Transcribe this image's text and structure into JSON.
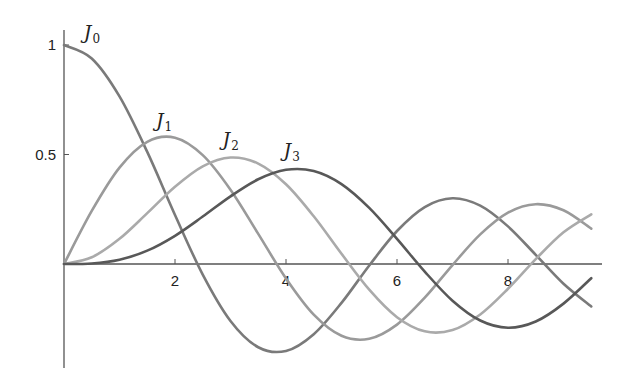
{
  "chart_data": {
    "type": "line",
    "title": "",
    "xlabel": "",
    "ylabel": "",
    "xlim": [
      0,
      9.7
    ],
    "ylim": [
      -0.45,
      1.07
    ],
    "grid": false,
    "legend": "inline labels near curve peaks",
    "x_ticks": [
      2,
      4,
      6,
      8
    ],
    "x_tick_labels": [
      "2",
      "4",
      "6",
      "8"
    ],
    "y_ticks": [
      0.5,
      1
    ],
    "y_tick_labels": [
      "0.5",
      "1"
    ],
    "x": [
      0,
      0.5,
      1,
      1.5,
      2,
      2.5,
      3,
      3.5,
      4,
      4.5,
      5,
      5.5,
      6,
      6.5,
      7,
      7.5,
      8,
      8.5,
      9,
      9.5
    ],
    "series": [
      {
        "name": "J0",
        "label_main": "J",
        "label_sub": "0",
        "color": "#7a7a7a",
        "label_pos": [
          0.5,
          1.0
        ],
        "values": [
          1,
          0.9385,
          0.7652,
          0.5118,
          0.2239,
          -0.0484,
          -0.2601,
          -0.3801,
          -0.3971,
          -0.3205,
          -0.1776,
          -0.0068,
          0.1506,
          0.2601,
          0.3001,
          0.2663,
          0.1717,
          0.0419,
          -0.0903,
          -0.1939
        ]
      },
      {
        "name": "J1",
        "label_main": "J",
        "label_sub": "1",
        "color": "#9a9a9a",
        "label_pos": [
          1.8,
          0.6
        ],
        "values": [
          0,
          0.2423,
          0.4401,
          0.5579,
          0.5767,
          0.4971,
          0.3391,
          0.1374,
          -0.066,
          -0.2311,
          -0.3276,
          -0.3414,
          -0.2767,
          -0.1538,
          -0.0047,
          0.1352,
          0.2346,
          0.2731,
          0.2453,
          0.1613
        ]
      },
      {
        "name": "J2",
        "label_main": "J",
        "label_sub": "2",
        "color": "#aaaaaa",
        "label_pos": [
          3.0,
          0.51
        ],
        "values": [
          0,
          0.0306,
          0.1149,
          0.2321,
          0.3528,
          0.4461,
          0.4861,
          0.4586,
          0.3641,
          0.2178,
          0.0466,
          -0.1173,
          -0.2429,
          -0.3074,
          -0.3014,
          -0.2303,
          -0.113,
          0.0223,
          0.1448,
          0.2268
        ]
      },
      {
        "name": "J3",
        "label_main": "J",
        "label_sub": "3",
        "color": "#585858",
        "label_pos": [
          4.1,
          0.46
        ],
        "values": [
          0,
          0.0026,
          0.0196,
          0.061,
          0.1289,
          0.2166,
          0.3091,
          0.3868,
          0.4302,
          0.4247,
          0.3648,
          0.2561,
          0.1148,
          -0.0349,
          -0.1676,
          -0.2581,
          -0.2911,
          -0.2626,
          -0.1809,
          -0.065
        ]
      }
    ]
  },
  "layout": {
    "origin_px": [
      64,
      264
    ],
    "px_per_x": 55.5,
    "px_per_y": 219,
    "x_axis_end_px": 602,
    "y_axis_top_px": 30,
    "y_axis_bottom_px": 368
  }
}
